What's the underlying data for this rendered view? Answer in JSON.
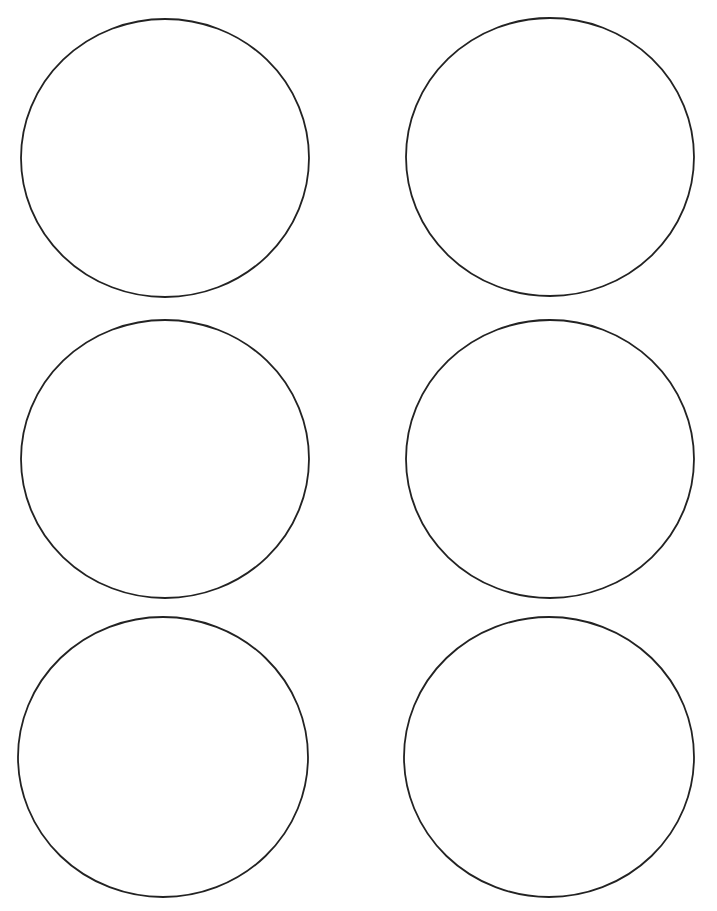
{
  "document": {
    "type": "printable round label template sheet",
    "layout": {
      "columns": 2,
      "rows": 3
    },
    "cut_off_header_text": ""
  },
  "labels": [
    {
      "id": 1,
      "cx": 165,
      "cy": 158,
      "rx": 144,
      "ry": 139
    },
    {
      "id": 2,
      "cx": 550,
      "cy": 157,
      "rx": 144,
      "ry": 139
    },
    {
      "id": 3,
      "cx": 165,
      "cy": 459,
      "rx": 144,
      "ry": 139
    },
    {
      "id": 4,
      "cx": 550,
      "cy": 459,
      "rx": 144,
      "ry": 139
    },
    {
      "id": 5,
      "cx": 163,
      "cy": 757,
      "rx": 145,
      "ry": 140
    },
    {
      "id": 6,
      "cx": 549,
      "cy": 757,
      "rx": 145,
      "ry": 140
    }
  ],
  "colors": {
    "stroke": "#222222",
    "background": "#ffffff"
  }
}
